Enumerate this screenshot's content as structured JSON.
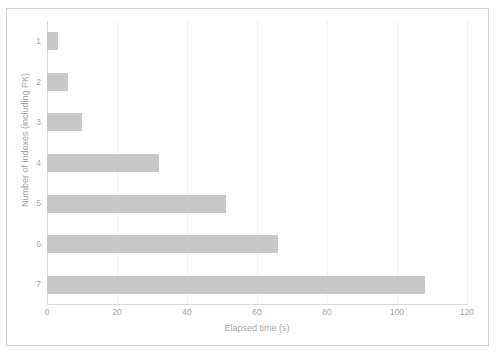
{
  "chart_data": {
    "type": "bar",
    "orientation": "horizontal",
    "title": "",
    "xlabel": "Elapsed time (s)",
    "ylabel": "Number of indexes (including PK)",
    "categories": [
      "1",
      "2",
      "3",
      "4",
      "5",
      "6",
      "7"
    ],
    "values": [
      3,
      6,
      10,
      32,
      51,
      66,
      108
    ],
    "xlim": [
      0,
      120
    ],
    "xticks": [
      0,
      20,
      40,
      60,
      80,
      100,
      120
    ],
    "xtick_labels": [
      "0",
      "20",
      "40",
      "60",
      "80",
      "100",
      "120"
    ],
    "grid": true,
    "grid_axis": "x",
    "legend": false,
    "series": [
      {
        "name": "Elapsed time (s)",
        "color": "#c8c8c8",
        "values": [
          3,
          6,
          10,
          32,
          51,
          66,
          108
        ]
      }
    ],
    "bar_color": "#c8c8c8",
    "gridline_color": "#f2f2f2",
    "axis_color": "#d9d9d9",
    "text_color": "#a6a6a6",
    "frame_color": "#d4d4d4",
    "background": "#ffffff"
  }
}
